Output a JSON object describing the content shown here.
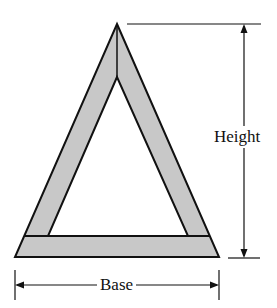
{
  "diagram": {
    "labels": {
      "height": "Height",
      "base": "Base"
    },
    "colors": {
      "frame_fill": "#c8c8c8",
      "stroke": "#111111",
      "background": "#ffffff"
    }
  }
}
